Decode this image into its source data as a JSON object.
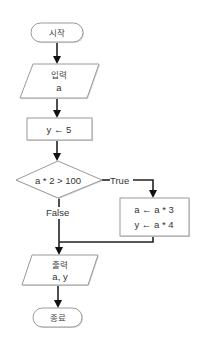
{
  "diagram": {
    "type": "flowchart",
    "nodes": {
      "start": {
        "shape": "terminator",
        "label": "시작"
      },
      "input": {
        "shape": "parallelogram",
        "line1": "입력",
        "line2": "a"
      },
      "assign_y": {
        "shape": "process",
        "label": "y ← 5"
      },
      "decision": {
        "shape": "diamond",
        "label": "a * 2 > 100"
      },
      "true_block": {
        "shape": "process",
        "line1": "a ← a * 3",
        "line2": "y ← a * 4"
      },
      "output": {
        "shape": "parallelogram",
        "line1": "출력",
        "line2": "a, y"
      },
      "end": {
        "shape": "terminator",
        "label": "종료"
      }
    },
    "edges": {
      "true_label": "True",
      "false_label": "False"
    }
  }
}
